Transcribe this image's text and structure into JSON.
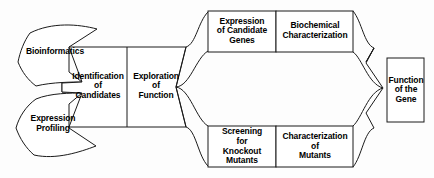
{
  "diagram": {
    "stroke_color": "#1a1a1a",
    "fill_color": "#ffffff",
    "background_color": "#fdfdfd",
    "inputs": [
      {
        "id": "bioinformatics",
        "label": "Bioinformatics"
      },
      {
        "id": "expression-profiling",
        "label": "Expression\nProfiling"
      }
    ],
    "pipeline": [
      {
        "id": "identification-of-candidates",
        "label": "Identification\nof\nCandidates"
      },
      {
        "id": "exploration-of-function",
        "label": "Exploration\nof\nFunction"
      }
    ],
    "upper_branch": [
      {
        "id": "expression-of-candidate-genes",
        "label": "Expression\nof Candidate\nGenes"
      },
      {
        "id": "biochemical-characterization",
        "label": "Biochemical\nCharacterization"
      }
    ],
    "lower_branch": [
      {
        "id": "screening-for-knockout-mutants",
        "label": "Screening\nfor\nKnockout\nMutants"
      },
      {
        "id": "characterization-of-mutants",
        "label": "Characterization\nof\nMutants"
      }
    ],
    "output": {
      "id": "function-of-the-gene",
      "label": "Function\nof the\nGene"
    }
  }
}
